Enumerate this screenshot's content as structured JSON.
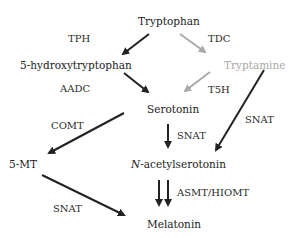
{
  "nodes": {
    "tryptophan": "Tryptophan",
    "hydroxytryptophan": "5-hydroxytryptophan",
    "tryptamine": "Tryptamine",
    "serotonin": "Serotonin",
    "mt5": "5-MT",
    "nacetyl_prefix": "N",
    "nacetyl_rest": "-acetylserotonin",
    "melatonin": "Melatonin"
  },
  "enzymes": {
    "tph": "TPH",
    "tdc": "TDC",
    "aadc": "AADC",
    "t5h": "T5H",
    "comt": "COMT",
    "snat_serotonin": "SNAT",
    "snat_tryptamine": "SNAT",
    "snat_5mt": "SNAT",
    "asmt": "ASMT/HIOMT"
  },
  "colors": {
    "primary_arrow": "#222222",
    "secondary_arrow": "#a9a9a9",
    "secondary_text": "#a9a9a9"
  }
}
